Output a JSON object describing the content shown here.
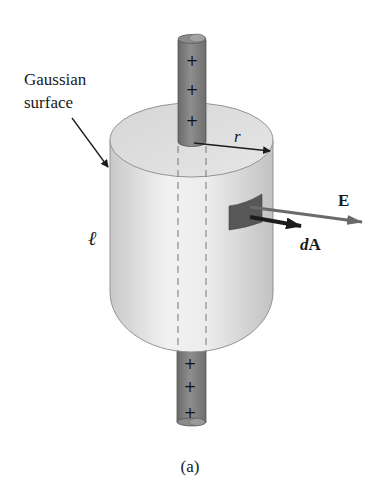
{
  "figure": {
    "caption": "(a)",
    "labels": {
      "gaussian_line1": "Gaussian",
      "gaussian_line2": "surface",
      "radius": "r",
      "length": "ℓ",
      "field": "E",
      "area_prefix": "d",
      "area_vector": "A"
    },
    "rod": {
      "charge_sign": "+",
      "top_charges": [
        "+",
        "+",
        "+"
      ],
      "bottom_charges": [
        "+",
        "+",
        "+"
      ]
    },
    "colors": {
      "background": "#ffffff",
      "cylinder_light": "#ececec",
      "cylinder_dark": "#bdbdbd",
      "cylinder_top": "#dcdcdc",
      "rod": "#7d7d7d",
      "rod_dark": "#5e5e5e",
      "patch": "#555555",
      "arrow": "#1c1c1c",
      "field_arrow": "#6a6a6a"
    }
  }
}
